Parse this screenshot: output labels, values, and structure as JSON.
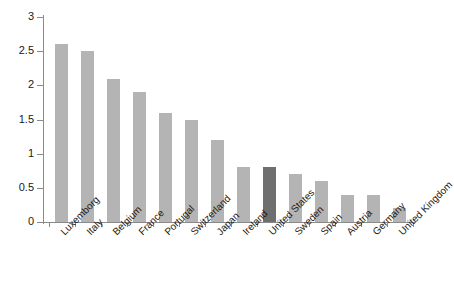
{
  "chart_data": {
    "type": "bar",
    "title": "",
    "subtitle": "",
    "xlabel": "",
    "ylabel": "",
    "ylim": [
      0,
      3
    ],
    "ytick_labels": [
      "0",
      "0.5",
      "1",
      "1.5",
      "2",
      "2.5",
      "3"
    ],
    "ytick_values": [
      0,
      0.5,
      1,
      1.5,
      2,
      2.5,
      3
    ],
    "grid": false,
    "legend": null,
    "categories": [
      "Luxemborg",
      "Italy",
      "Belgium",
      "France",
      "Portugal",
      "Switzerland",
      "Japan",
      "Ireland",
      "United States",
      "Sweden",
      "Spain",
      "Austria",
      "Germany",
      "United Kingdom"
    ],
    "values": [
      2.6,
      2.5,
      2.1,
      1.9,
      1.6,
      1.5,
      1.2,
      0.8,
      0.8,
      0.7,
      0.6,
      0.4,
      0.4,
      0.2
    ],
    "highlight_category": "United States",
    "colors": {
      "bar": "#b4b4b4",
      "bar_highlight": "#6f6f6f",
      "axis": "#8a8a8a",
      "text": "#1a1a1a",
      "background": "#ffffff"
    }
  }
}
